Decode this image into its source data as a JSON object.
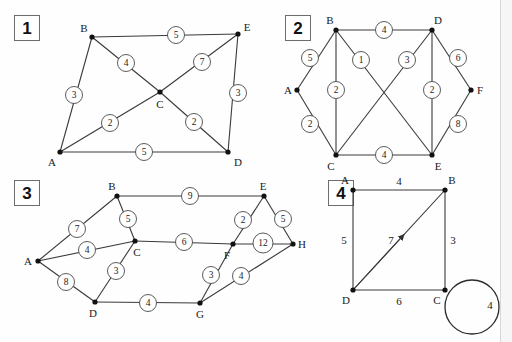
{
  "page": {
    "background_color": "#fefefe",
    "ink_color": "#1a1a1a",
    "edge_color": "#3a3a3a"
  },
  "panels": [
    {
      "number": "1",
      "nodes": [
        {
          "id": "A",
          "label": "A",
          "x": 60,
          "y": 152,
          "label_x": 52,
          "label_y": 162
        },
        {
          "id": "B",
          "label": "B",
          "x": 92,
          "y": 37,
          "label_x": 84,
          "label_y": 28
        },
        {
          "id": "C",
          "label": "C",
          "x": 160,
          "y": 92,
          "label_x": 160,
          "label_y": 104
        },
        {
          "id": "D",
          "label": "D",
          "x": 228,
          "y": 152,
          "label_x": 238,
          "label_y": 162
        },
        {
          "id": "E",
          "label": "E",
          "x": 238,
          "y": 34,
          "label_x": 247,
          "label_y": 27
        }
      ],
      "edges": [
        {
          "from": "B",
          "to": "E",
          "weight": "5",
          "label_x": 176,
          "label_y": 35
        },
        {
          "from": "A",
          "to": "B",
          "weight": "3",
          "label_x": 74,
          "label_y": 95
        },
        {
          "from": "B",
          "to": "C",
          "weight": "4",
          "label_x": 126,
          "label_y": 63
        },
        {
          "from": "A",
          "to": "C",
          "weight": "2",
          "label_x": 110,
          "label_y": 123
        },
        {
          "from": "C",
          "to": "E",
          "weight": "7",
          "label_x": 202,
          "label_y": 62
        },
        {
          "from": "C",
          "to": "D",
          "weight": "2",
          "label_x": 194,
          "label_y": 122
        },
        {
          "from": "A",
          "to": "D",
          "weight": "5",
          "label_x": 144,
          "label_y": 152
        },
        {
          "from": "D",
          "to": "E",
          "weight": "3",
          "label_x": 238,
          "label_y": 93
        }
      ]
    },
    {
      "number": "2",
      "nodes": [
        {
          "id": "A",
          "label": "A",
          "x": 297,
          "y": 90,
          "label_x": 288,
          "label_y": 90
        },
        {
          "id": "B",
          "label": "B",
          "x": 336,
          "y": 30,
          "label_x": 330,
          "label_y": 20
        },
        {
          "id": "C",
          "label": "C",
          "x": 336,
          "y": 155,
          "label_x": 331,
          "label_y": 166
        },
        {
          "id": "D",
          "label": "D",
          "x": 432,
          "y": 30,
          "label_x": 438,
          "label_y": 20
        },
        {
          "id": "E",
          "label": "E",
          "x": 432,
          "y": 155,
          "label_x": 438,
          "label_y": 166
        },
        {
          "id": "F",
          "label": "F",
          "x": 471,
          "y": 90,
          "label_x": 480,
          "label_y": 90
        }
      ],
      "edges": [
        {
          "from": "B",
          "to": "D",
          "weight": "4",
          "label_x": 384,
          "label_y": 30
        },
        {
          "from": "A",
          "to": "B",
          "weight": "5",
          "label_x": 310,
          "label_y": 58
        },
        {
          "from": "A",
          "to": "C",
          "weight": "2",
          "label_x": 310,
          "label_y": 124
        },
        {
          "from": "B",
          "to": "C",
          "weight": "2",
          "label_x": 336,
          "label_y": 90
        },
        {
          "from": "B",
          "to": "E",
          "weight": "1",
          "label_x": 361,
          "label_y": 60
        },
        {
          "from": "C",
          "to": "D",
          "weight": "3",
          "label_x": 407,
          "label_y": 60
        },
        {
          "from": "D",
          "to": "E",
          "weight": "2",
          "label_x": 432,
          "label_y": 90
        },
        {
          "from": "D",
          "to": "F",
          "weight": "6",
          "label_x": 458,
          "label_y": 58
        },
        {
          "from": "E",
          "to": "F",
          "weight": "8",
          "label_x": 458,
          "label_y": 124
        },
        {
          "from": "C",
          "to": "E",
          "weight": "4",
          "label_x": 384,
          "label_y": 155
        }
      ]
    },
    {
      "number": "3",
      "nodes": [
        {
          "id": "A",
          "label": "A",
          "x": 38,
          "y": 261,
          "label_x": 28,
          "label_y": 261
        },
        {
          "id": "B",
          "label": "B",
          "x": 117,
          "y": 196,
          "label_x": 112,
          "label_y": 186
        },
        {
          "id": "C",
          "label": "C",
          "x": 135,
          "y": 241,
          "label_x": 137,
          "label_y": 252
        },
        {
          "id": "D",
          "label": "D",
          "x": 95,
          "y": 302,
          "label_x": 93,
          "label_y": 313
        },
        {
          "id": "E",
          "label": "E",
          "x": 264,
          "y": 196,
          "label_x": 263,
          "label_y": 186
        },
        {
          "id": "F",
          "label": "F",
          "x": 233,
          "y": 244,
          "label_x": 227,
          "label_y": 255
        },
        {
          "id": "G",
          "label": "G",
          "x": 200,
          "y": 303,
          "label_x": 200,
          "label_y": 314
        },
        {
          "id": "H",
          "label": "H",
          "x": 293,
          "y": 244,
          "label_x": 302,
          "label_y": 244
        }
      ],
      "edges": [
        {
          "from": "B",
          "to": "E",
          "weight": "9",
          "label_x": 190,
          "label_y": 196
        },
        {
          "from": "A",
          "to": "B",
          "weight": "7",
          "label_x": 77,
          "label_y": 229
        },
        {
          "from": "B",
          "to": "C",
          "weight": "5",
          "label_x": 128,
          "label_y": 219
        },
        {
          "from": "A",
          "to": "C",
          "weight": "4",
          "label_x": 87,
          "label_y": 250
        },
        {
          "from": "A",
          "to": "D",
          "weight": "8",
          "label_x": 66,
          "label_y": 282
        },
        {
          "from": "C",
          "to": "D",
          "weight": "3",
          "label_x": 116,
          "label_y": 271
        },
        {
          "from": "C",
          "to": "F",
          "weight": "6",
          "label_x": 184,
          "label_y": 242
        },
        {
          "from": "D",
          "to": "G",
          "weight": "4",
          "label_x": 148,
          "label_y": 303
        },
        {
          "from": "E",
          "to": "F",
          "weight": "2",
          "label_x": 243,
          "label_y": 220
        },
        {
          "from": "E",
          "to": "H",
          "weight": "5",
          "label_x": 283,
          "label_y": 219
        },
        {
          "from": "F",
          "to": "H",
          "weight": "12",
          "label_x": 263,
          "label_y": 243
        },
        {
          "from": "F",
          "to": "G",
          "weight": "3",
          "label_x": 211,
          "label_y": 275
        },
        {
          "from": "G",
          "to": "H",
          "weight": "4",
          "label_x": 241,
          "label_y": 276
        }
      ]
    },
    {
      "number": "4",
      "nodes": [
        {
          "id": "A",
          "label": "A",
          "x": 353,
          "y": 190,
          "label_x": 345,
          "label_y": 180
        },
        {
          "id": "B",
          "label": "B",
          "x": 445,
          "y": 190,
          "label_x": 452,
          "label_y": 180
        },
        {
          "id": "C",
          "label": "C",
          "x": 445,
          "y": 290,
          "label_x": 437,
          "label_y": 300
        },
        {
          "id": "D",
          "label": "D",
          "x": 353,
          "y": 290,
          "label_x": 346,
          "label_y": 300
        }
      ],
      "edges": [
        {
          "from": "A",
          "to": "B",
          "weight": "4",
          "label_x": 399,
          "label_y": 181
        },
        {
          "from": "A",
          "to": "D",
          "weight": "5",
          "label_x": 344,
          "label_y": 240
        },
        {
          "from": "B",
          "to": "C",
          "weight": "3",
          "label_x": 453,
          "label_y": 240
        },
        {
          "from": "D",
          "to": "C",
          "weight": "6",
          "label_x": 399,
          "label_y": 301
        },
        {
          "from": "D",
          "to": "B",
          "weight": "7",
          "label_x": 391,
          "label_y": 240,
          "directed": true
        }
      ],
      "self_loop": {
        "node": "C",
        "weight": "4",
        "center_x": 472,
        "center_y": 307,
        "radius": 27,
        "label_x": 490,
        "label_y": 305
      }
    }
  ]
}
